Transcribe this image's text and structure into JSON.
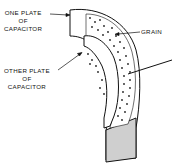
{
  "diagram": {
    "labels": {
      "one_plate": [
        "ONE PLATE",
        "OF",
        "CAPACITOR"
      ],
      "other_plate": [
        "OTHER PLATE",
        "OF",
        "CAPACITOR"
      ],
      "grain": "GRAIN"
    },
    "colors": {
      "ink": "#111111",
      "plate_fill": "#ffffff",
      "shaded_face": "#cfcfcf",
      "background": "#ffffff"
    }
  }
}
